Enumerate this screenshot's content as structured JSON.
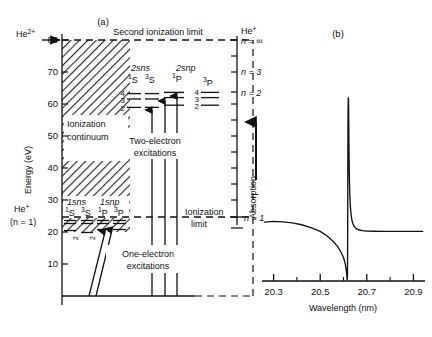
{
  "figure": {
    "panel_a_label": "(a)",
    "panel_b_label": "(b)"
  },
  "panel_a": {
    "y_axis_title": "Energy (eV)",
    "y_ticks": [
      "10",
      "20",
      "30",
      "40",
      "50",
      "60",
      "70",
      "80"
    ],
    "y_tick_values": [
      10,
      20,
      30,
      40,
      50,
      60,
      70,
      80
    ],
    "top_label": "Second ionization limit",
    "he2plus_label": "He",
    "he2plus_charge": "2+",
    "heplus_left_label": "He",
    "heplus_left_charge": "+",
    "heplus_left_sub": "(n = 1)",
    "continuum_label_line1": "Ionization",
    "continuum_label_line2": "continuum",
    "ionization_limit_line1": "Ionization",
    "ionization_limit_line2": "limit",
    "two_electron_line1": "Two-electron",
    "two_electron_line2": "excitations",
    "one_electron_line1": "One-electron",
    "one_electron_line2": "excitations",
    "series_2sns_label": "2sns",
    "series_2snp_label": "2snp",
    "series_1sns_label": "1sns",
    "series_1snp_label": "1snp",
    "term_1S": "S",
    "term_1S_sup": "1",
    "term_3S": "S",
    "term_3S_sup": "3",
    "term_1P": "P",
    "term_1P_sup": "1",
    "term_3P": "P",
    "term_3P_sup": "3",
    "level_n_labels": [
      "4",
      "3",
      "2"
    ],
    "right_axis": {
      "he_label": "He",
      "he_charge": "+",
      "n_infinity": "n = ∞",
      "n_3": "n = 3",
      "n_2": "n = 2",
      "n_1": "n = 1",
      "absorption_label": "Absorption"
    },
    "levels_2sns_eV": [
      64.5,
      62.8,
      60.2
    ],
    "levels_2snp_eV": [
      64.9,
      63.3,
      60.9
    ],
    "levels_1sns_eV": [
      23.7,
      22.9,
      20.6
    ],
    "levels_1snp_eV": [
      23.8,
      23.0,
      21.2
    ],
    "second_ionization_limit_eV": 79.0,
    "first_ionization_limit_eV": 24.6,
    "ground_state_eV": 0
  },
  "chart_data": {
    "type": "line",
    "title": "",
    "xlabel": "Wavelength (nm)",
    "ylabel": "",
    "xlim": [
      20.25,
      20.95
    ],
    "ylim": [
      0,
      1
    ],
    "x_ticks": [
      20.3,
      20.5,
      20.7,
      20.9
    ],
    "x_tick_labels": [
      "20.3",
      "20.5",
      "20.7",
      "20.9"
    ],
    "x_minor_ticks": [
      20.4,
      20.6,
      20.8
    ],
    "grid": false,
    "legend": null,
    "annotation": "Fano resonance absorption profile",
    "resonance_center_nm": 20.62,
    "series": [
      {
        "name": "absorption",
        "x": [
          20.26,
          20.3,
          20.34,
          20.38,
          20.42,
          20.46,
          20.5,
          20.53,
          20.555,
          20.575,
          20.59,
          20.6,
          20.607,
          20.611,
          20.6135,
          20.6145,
          20.615,
          20.6155,
          20.616,
          20.6165,
          20.617,
          20.6175,
          20.618,
          20.6185,
          20.619,
          20.6195,
          20.62,
          20.6205,
          20.621,
          20.6215,
          20.622,
          20.6225,
          20.623,
          20.624,
          20.625,
          20.627,
          20.629,
          20.632,
          20.636,
          20.641,
          20.647,
          20.655,
          20.665,
          20.68,
          20.7,
          20.73,
          20.77,
          20.82,
          20.88,
          20.94
        ],
        "y": [
          0.318,
          0.322,
          0.32,
          0.314,
          0.304,
          0.289,
          0.268,
          0.243,
          0.215,
          0.186,
          0.154,
          0.127,
          0.095,
          0.066,
          0.042,
          0.028,
          0.018,
          0.011,
          0.008,
          0.012,
          0.04,
          0.12,
          0.3,
          0.56,
          0.78,
          0.9,
          0.96,
          0.985,
          0.99,
          0.975,
          0.93,
          0.86,
          0.78,
          0.66,
          0.575,
          0.47,
          0.412,
          0.365,
          0.33,
          0.308,
          0.293,
          0.283,
          0.277,
          0.272,
          0.27,
          0.269,
          0.268,
          0.268,
          0.268,
          0.268
        ]
      }
    ]
  }
}
